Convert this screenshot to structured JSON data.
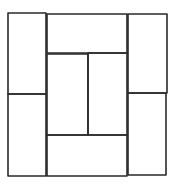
{
  "diagram": {
    "stroke_color": "#2a2a2a",
    "background": "#ffffff",
    "stroke_width": 1.6,
    "rects": [
      {
        "name": "left-top",
        "x": 8,
        "y": 13,
        "w": 38,
        "h": 81
      },
      {
        "name": "left-bottom",
        "x": 8,
        "y": 94,
        "w": 38,
        "h": 82
      },
      {
        "name": "top-center",
        "x": 47,
        "y": 14,
        "w": 80,
        "h": 39
      },
      {
        "name": "center-left",
        "x": 47,
        "y": 54,
        "w": 41,
        "h": 81
      },
      {
        "name": "center-right",
        "x": 88,
        "y": 53,
        "w": 39,
        "h": 82
      },
      {
        "name": "bottom-center",
        "x": 47,
        "y": 135,
        "w": 80,
        "h": 41
      },
      {
        "name": "right-top",
        "x": 128,
        "y": 14,
        "w": 39,
        "h": 79
      },
      {
        "name": "right-bottom",
        "x": 128,
        "y": 93,
        "w": 38,
        "h": 82
      }
    ]
  }
}
